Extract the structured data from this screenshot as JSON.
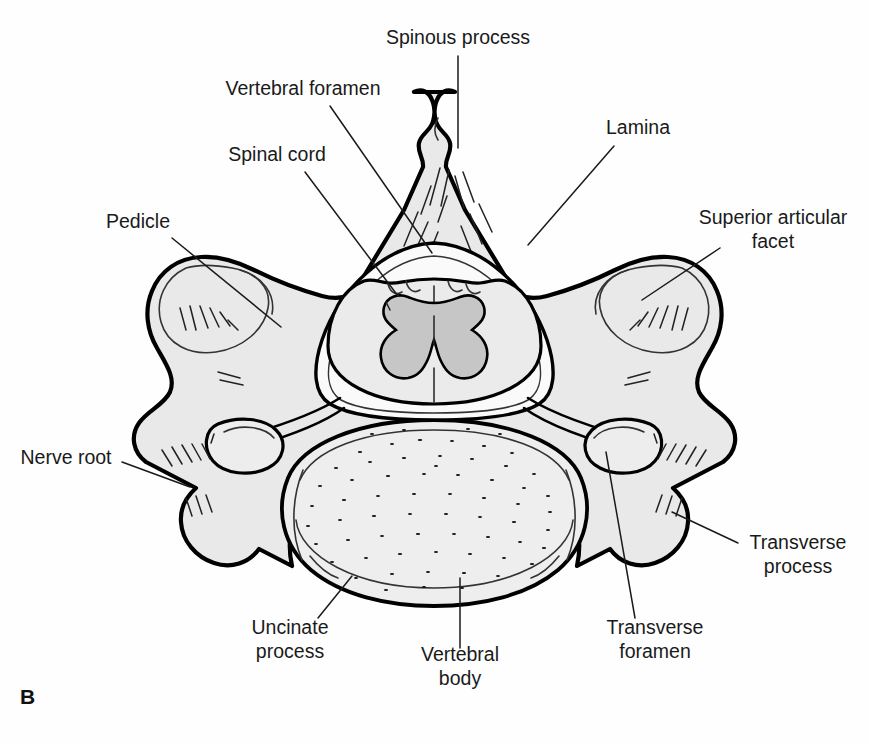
{
  "figure": {
    "panel_letter": "B",
    "colors": {
      "bone_fill": "#e9e9e9",
      "outline": "#000000",
      "gray_matter": "#c6c6c6",
      "white_matter": "#ebebeb",
      "label_text": "#1a1a1a",
      "background": "#ffffff"
    }
  },
  "labels": [
    {
      "id": "spinous-process",
      "text": "Spinous process",
      "lines": [
        "Spinous process"
      ],
      "x": 458,
      "y": 44,
      "anchor": "middle",
      "leader": {
        "x1": 458,
        "y1": 56,
        "x2": 458,
        "y2": 148
      }
    },
    {
      "id": "vertebral-foramen",
      "text": "Vertebral foramen",
      "lines": [
        "Vertebral foramen"
      ],
      "x": 303,
      "y": 95,
      "anchor": "middle",
      "leader": {
        "x1": 330,
        "y1": 106,
        "x2": 432,
        "y2": 253
      }
    },
    {
      "id": "spinal-cord",
      "text": "Spinal cord",
      "lines": [
        "Spinal cord"
      ],
      "x": 277,
      "y": 161,
      "anchor": "middle",
      "leader": {
        "x1": 305,
        "y1": 172,
        "x2": 398,
        "y2": 296
      }
    },
    {
      "id": "pedicle",
      "text": "Pedicle",
      "lines": [
        "Pedicle"
      ],
      "x": 138,
      "y": 228,
      "anchor": "middle",
      "leader": {
        "x1": 172,
        "y1": 238,
        "x2": 281,
        "y2": 327
      }
    },
    {
      "id": "lamina",
      "text": "Lamina",
      "lines": [
        "Lamina"
      ],
      "x": 638,
      "y": 134,
      "anchor": "middle",
      "leader": {
        "x1": 614,
        "y1": 146,
        "x2": 528,
        "y2": 245
      }
    },
    {
      "id": "superior-articular-facet",
      "text": "Superior articular facet",
      "lines": [
        "Superior articular",
        "facet"
      ],
      "x": 773,
      "y": 224,
      "anchor": "middle",
      "leader": {
        "x1": 720,
        "y1": 248,
        "x2": 642,
        "y2": 300
      }
    },
    {
      "id": "nerve-root",
      "text": "Nerve root",
      "lines": [
        "Nerve root"
      ],
      "x": 66,
      "y": 464,
      "anchor": "middle",
      "leader": {
        "x1": 122,
        "y1": 462,
        "x2": 190,
        "y2": 487
      }
    },
    {
      "id": "transverse-process",
      "text": "Transverse process",
      "lines": [
        "Transverse",
        "process"
      ],
      "x": 798,
      "y": 549,
      "anchor": "middle",
      "leader": {
        "x1": 738,
        "y1": 543,
        "x2": 672,
        "y2": 512
      }
    },
    {
      "id": "uncinate-process",
      "text": "Uncinate process",
      "lines": [
        "Uncinate",
        "process"
      ],
      "x": 290,
      "y": 634,
      "anchor": "middle",
      "leader": {
        "x1": 318,
        "y1": 618,
        "x2": 352,
        "y2": 576
      }
    },
    {
      "id": "transverse-foramen",
      "text": "Transverse foramen",
      "lines": [
        "Transverse",
        "foramen"
      ],
      "x": 655,
      "y": 634,
      "anchor": "middle",
      "leader": {
        "x1": 635,
        "y1": 618,
        "x2": 606,
        "y2": 452
      }
    },
    {
      "id": "vertebral-body",
      "text": "Vertebral body",
      "lines": [
        "Vertebral",
        "body"
      ],
      "x": 460,
      "y": 661,
      "anchor": "middle",
      "leader": {
        "x1": 460,
        "y1": 648,
        "x2": 460,
        "y2": 578
      }
    }
  ]
}
